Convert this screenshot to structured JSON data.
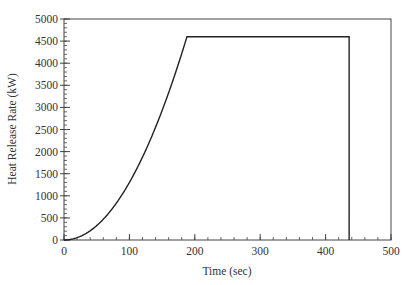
{
  "chart_data": {
    "type": "line",
    "title": "",
    "xlabel": "Time (sec)",
    "ylabel": "Heat Release Rate (kW)",
    "xlim": [
      0,
      500
    ],
    "ylim": [
      0,
      5000
    ],
    "x_ticks": [
      0,
      100,
      200,
      300,
      400,
      500
    ],
    "y_ticks": [
      0,
      500,
      1000,
      1500,
      2000,
      2500,
      3000,
      3500,
      4000,
      4500,
      5000
    ],
    "x_minor_step": 20,
    "y_minor_step": 100,
    "grid": false,
    "legend": null,
    "series": [
      {
        "name": "Heat Release Rate",
        "description": "t-squared growth (approx. 0.13 t^2) to peak, steady plateau, then abrupt drop",
        "x": [
          0,
          20,
          40,
          60,
          80,
          100,
          120,
          140,
          160,
          180,
          188,
          436,
          436
        ],
        "y": [
          0,
          52,
          208,
          468,
          832,
          1300,
          1872,
          2548,
          3328,
          4212,
          4600,
          4600,
          0
        ]
      }
    ],
    "colors": {
      "line": "#222222",
      "axis": "#444444",
      "text": "#333333"
    }
  },
  "axes": {
    "x_title": "Time (sec)",
    "y_title": "Heat Release Rate (kW)",
    "x_tick_labels": [
      "0",
      "100",
      "200",
      "300",
      "400",
      "500"
    ],
    "y_tick_labels": [
      "0",
      "500",
      "1000",
      "1500",
      "2000",
      "2500",
      "3000",
      "3500",
      "4000",
      "4500",
      "5000"
    ]
  }
}
